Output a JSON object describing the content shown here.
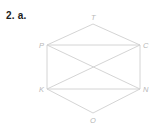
{
  "problem": {
    "number": "2.",
    "part": "a."
  },
  "diagram": {
    "vertices": [
      {
        "id": "T",
        "label": "T",
        "x": 93,
        "y": 24,
        "lx": 91,
        "ly": 20
      },
      {
        "id": "P",
        "label": "P",
        "x": 47,
        "y": 45,
        "lx": 39,
        "ly": 48
      },
      {
        "id": "C",
        "label": "C",
        "x": 140,
        "y": 45,
        "lx": 143,
        "ly": 48
      },
      {
        "id": "K",
        "label": "K",
        "x": 47,
        "y": 89,
        "lx": 39,
        "ly": 92
      },
      {
        "id": "N",
        "label": "N",
        "x": 140,
        "y": 89,
        "lx": 143,
        "ly": 92
      },
      {
        "id": "O",
        "label": "O",
        "x": 93,
        "y": 113,
        "lx": 90,
        "ly": 123
      }
    ],
    "edges": [
      [
        "T",
        "P"
      ],
      [
        "T",
        "C"
      ],
      [
        "P",
        "C"
      ],
      [
        "P",
        "K"
      ],
      [
        "C",
        "N"
      ],
      [
        "K",
        "N"
      ],
      [
        "P",
        "N"
      ],
      [
        "K",
        "C"
      ],
      [
        "K",
        "O"
      ],
      [
        "N",
        "O"
      ]
    ],
    "colors": {
      "edge": "#cfcfcf",
      "label": "#b8b8b8",
      "heading": "#222222"
    }
  }
}
